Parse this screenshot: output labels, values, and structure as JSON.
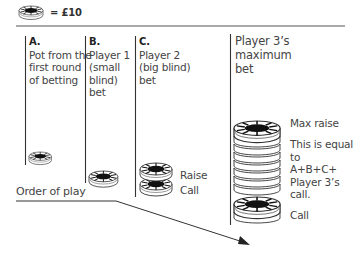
{
  "legend": {
    "icon": "poker-chip-icon",
    "label": "= £10"
  },
  "columns": [
    {
      "letter": "A.",
      "lines": [
        "Pot from the",
        "first round",
        "of betting"
      ]
    },
    {
      "letter": "B.",
      "lines": [
        "Player 1",
        "(small",
        "blind)",
        "bet"
      ]
    },
    {
      "letter": "C.",
      "lines": [
        "Player 2",
        "(big blind)",
        "bet"
      ]
    },
    {
      "letter": "",
      "lines": [
        "Player 3’s",
        "maximum",
        "bet"
      ]
    }
  ],
  "labels": {
    "c_raise": "Raise",
    "c_call": "Call",
    "max_raise": "Max raise",
    "equal_note": [
      "This is equal",
      "to",
      "A+B+C+",
      "Player 3’s",
      "call."
    ],
    "p3_call": "Call",
    "order_of_play": "Order of play"
  },
  "colors": {
    "line": "#333333",
    "chip_fill": "#ffffff",
    "chip_center": "#111111"
  }
}
